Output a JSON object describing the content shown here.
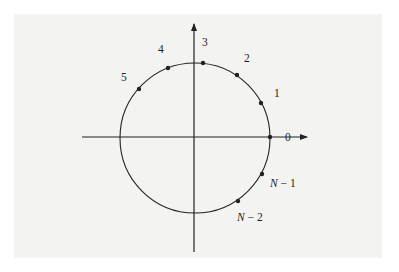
{
  "diagram": {
    "type": "unit-circle-roots-of-unity",
    "colors": {
      "background_panel": "#f3f3f2",
      "stroke": "#222222"
    },
    "axes": {
      "horizontal": {
        "x1": 82,
        "y": 137,
        "x2": 307
      },
      "vertical": {
        "x": 194,
        "y1": 252,
        "y2": 24
      }
    },
    "circle": {
      "cx": 195,
      "cy": 138,
      "r": 75
    },
    "points": [
      {
        "id": "0",
        "x": 270,
        "y": 137
      },
      {
        "id": "1",
        "x": 261,
        "y": 103
      },
      {
        "id": "2",
        "x": 237,
        "y": 75
      },
      {
        "id": "3",
        "x": 203,
        "y": 63
      },
      {
        "id": "4",
        "x": 168,
        "y": 68
      },
      {
        "id": "5",
        "x": 139,
        "y": 89
      },
      {
        "id": "N-1",
        "x": 262,
        "y": 174
      },
      {
        "id": "N-2",
        "x": 238,
        "y": 201
      }
    ],
    "labels": {
      "p0": "0",
      "p1": "1",
      "p2": "2",
      "p3": "3",
      "p4": "4",
      "p5": "5",
      "pN1": "N − 1",
      "pN2": "N − 2",
      "N": "N",
      "minus1": " − 1",
      "minus2": " − 2"
    }
  }
}
